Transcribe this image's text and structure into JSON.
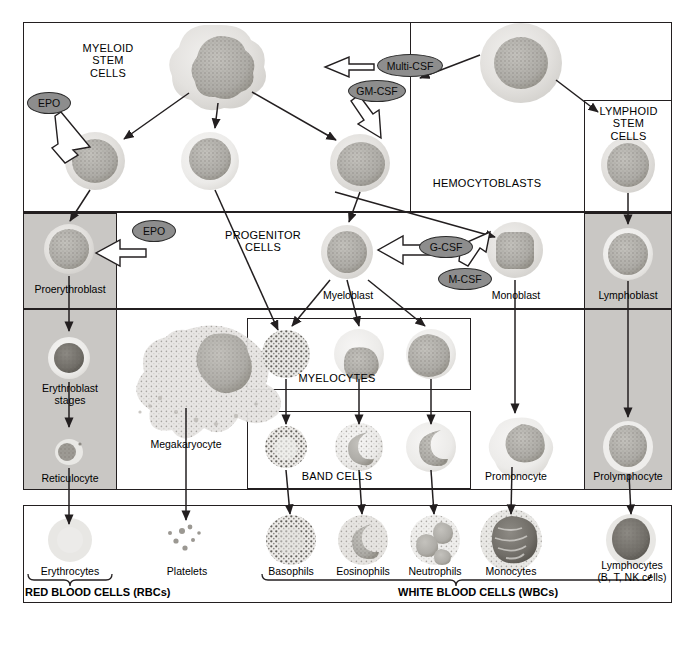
{
  "diagram": {
    "boxes": {
      "myeloid_stem": "MYELOID\nSTEM\nCELLS",
      "lymphoid_stem": "LYMPHOID\nSTEM\nCELLS",
      "hemocytoblasts": "HEMOCYTOBLASTS",
      "progenitor": "PROGENITOR\nCELLS",
      "myelocytes": "MYELOCYTES",
      "band_cells": "BAND CELLS"
    },
    "growth_factors": [
      {
        "id": "multi-csf",
        "label": "Multi-CSF"
      },
      {
        "id": "gm-csf",
        "label": "GM-CSF"
      },
      {
        "id": "epo-top",
        "label": "EPO"
      },
      {
        "id": "epo-mid",
        "label": "EPO"
      },
      {
        "id": "g-csf",
        "label": "G-CSF"
      },
      {
        "id": "m-csf",
        "label": "M-CSF"
      }
    ],
    "cell_labels": {
      "proerythroblast": "Proerythroblast",
      "erythroblast_stages": "Erythroblast\nstages",
      "reticulocyte": "Reticulocyte",
      "megakaryocyte": "Megakaryocyte",
      "myeloblast": "Myeloblast",
      "monoblast": "Monoblast",
      "lymphoblast": "Lymphoblast",
      "promonocyte": "Promonocyte",
      "prolymphocyte": "Prolymphocyte"
    },
    "mature_cells": [
      {
        "id": "erythrocytes",
        "label": "Erythrocytes"
      },
      {
        "id": "platelets",
        "label": "Platelets"
      },
      {
        "id": "basophils",
        "label": "Basophils"
      },
      {
        "id": "eosinophils",
        "label": "Eosinophils"
      },
      {
        "id": "neutrophils",
        "label": "Neutrophils"
      },
      {
        "id": "monocytes",
        "label": "Monocytes"
      },
      {
        "id": "lymphocytes",
        "label": "Lymphocytes\n(B, T, NK cells)"
      }
    ],
    "footers": {
      "rbc": "RED BLOOD CELLS (RBCs)",
      "wbc": "WHITE BLOOD CELLS (WBCs)"
    },
    "colors": {
      "stroke": "#231f20",
      "shade": "#c9c7c4",
      "pill_fill": "#8d8d8d",
      "text": "#000000"
    }
  }
}
